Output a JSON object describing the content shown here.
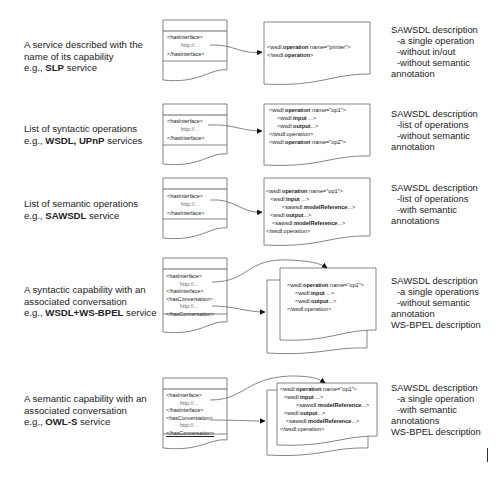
{
  "rows": [
    {
      "label": {
        "line1": "A service described with the",
        "line2": "name of its capability",
        "prefix": "e.g., ",
        "bold": "SLP",
        "suffix": " service"
      },
      "left_doc": {
        "lines": [
          "<hasInterface>",
          "http://...",
          "</hasInterface>"
        ]
      },
      "right_doc": {
        "lines": [
          {
            "pre": "<wsdl:",
            "bold": "operation",
            "post": " name=\"printer\">"
          },
          {
            "pre": "</wsdl:",
            "bold": "operation",
            "post": ">"
          }
        ]
      },
      "desc": {
        "title": "SAWSDL description",
        "items": [
          "-a single operation",
          "-without in/out",
          "-without semantic"
        ],
        "tail": [
          "annotation"
        ]
      }
    },
    {
      "label": {
        "line1": "List of syntactic operations",
        "line2": "",
        "prefix": "e.g., ",
        "bold": "WSDL, UPnP",
        "suffix": " services"
      },
      "left_doc": {
        "lines": [
          "<hasInterface>",
          "http://...",
          "</hasInterface>"
        ]
      },
      "right_doc": {
        "lines": [
          {
            "pre": "<wsdl:",
            "bold": "operation",
            "post": " name=\"op1\">"
          },
          {
            "pre": "<wsdl:",
            "bold": "input",
            "post": " ...>"
          },
          {
            "pre": "<wsdl:",
            "bold": "output",
            "post": "...>"
          },
          {
            "pre": "</wsdl:",
            "bold": "",
            "post": "operation>"
          },
          {
            "pre": "<wsdl:",
            "bold": "operation",
            "post": " name=\"op2\">"
          }
        ]
      },
      "desc": {
        "title": "SAWSDL description",
        "items": [
          "-list of operations",
          "-without semantic"
        ],
        "tail": [
          "annotation"
        ]
      }
    },
    {
      "label": {
        "line1": "List of semantic operations",
        "line2": "",
        "prefix": "e.g., ",
        "bold": "SAWSDL",
        "suffix": " service"
      },
      "left_doc": {
        "lines": [
          "<hasInterface>",
          "http://...",
          "</hasInterface>"
        ]
      },
      "right_doc": {
        "lines": [
          {
            "pre": "<wsdl:",
            "bold": "operation",
            "post": " name=\"op1\">"
          },
          {
            "pre": "<wsdl:",
            "bold": "input",
            "post": " ...>"
          },
          {
            "pre": "<sawsdl:",
            "bold": "modelReference",
            "post": "...>"
          },
          {
            "pre": "<wsdl:",
            "bold": "output",
            "post": "...>"
          },
          {
            "pre": "<sawsdl:",
            "bold": "modelReference",
            "post": "...>"
          },
          {
            "pre": "</wsdl:",
            "bold": "",
            "post": "operation>"
          }
        ]
      },
      "desc": {
        "title": "SAWSDL description",
        "items": [
          "-list of operations",
          "-with semantic"
        ],
        "tail": [
          "annotations"
        ]
      }
    },
    {
      "label": {
        "line1": "A syntactic capability with an",
        "line2": "associated conversation",
        "prefix": "e.g., ",
        "bold": "WSDL+WS-BPEL",
        "suffix": " service"
      },
      "left_doc": {
        "lines": [
          "<hasInterface>",
          "http://...",
          "</hasInterface>",
          "<hasConversation>",
          "http://...",
          "</hasConversation>"
        ]
      },
      "right_doc": {
        "lines": [
          {
            "pre": "<wsdl:",
            "bold": "operation",
            "post": " name=\"op1\">"
          },
          {
            "pre": "<wsdl:",
            "bold": "input",
            "post": " ...>"
          },
          {
            "pre": "<wsdl:",
            "bold": "output",
            "post": "...>"
          },
          {
            "pre": "</wsdl:",
            "bold": "",
            "post": "operation>"
          }
        ]
      },
      "desc": {
        "title": "SAWSDL description",
        "items": [
          "-a single operations",
          "-without semantic"
        ],
        "tail": [
          "annotation",
          "WS-BPEL description"
        ]
      }
    },
    {
      "label": {
        "line1": "A semantic capability with an",
        "line2": "associated conversation",
        "prefix": "e.g., ",
        "bold": "OWL-S",
        "suffix": " service"
      },
      "left_doc": {
        "lines": [
          "<hasInterface>",
          "http://...",
          "</hasInterface>",
          "<hasConversation>",
          "http://...",
          "</hasConversation>"
        ]
      },
      "right_doc": {
        "lines": [
          {
            "pre": "<wsdl:",
            "bold": "operation",
            "post": " name=\"op1\">"
          },
          {
            "pre": "<wsdl:",
            "bold": "input",
            "post": " ...>"
          },
          {
            "pre": "<sawsdl:",
            "bold": "modelReference",
            "post": "...>"
          },
          {
            "pre": "<wsdl:",
            "bold": "output",
            "post": "...>"
          },
          {
            "pre": "<sawsdl:",
            "bold": "modelReference",
            "post": "...>"
          },
          {
            "pre": "</wsdl:",
            "bold": "",
            "post": "operation>"
          }
        ]
      },
      "desc": {
        "title": "SAWSDL description",
        "items": [
          "-a single operation",
          "-with semantic"
        ],
        "tail": [
          "annotations",
          "WS-BPEL description"
        ]
      }
    }
  ],
  "colors": {
    "ink": "#222222",
    "line": "#555555",
    "background": "#ffffff"
  }
}
